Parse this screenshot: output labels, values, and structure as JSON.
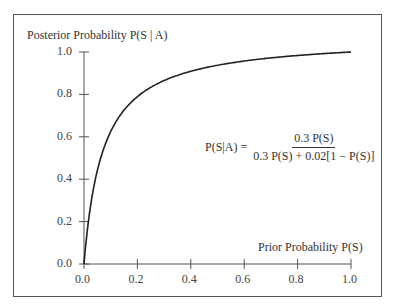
{
  "chart_data": {
    "type": "line",
    "title": "",
    "ylabel": "Posterior Probability P(S | A)",
    "xlabel": "Prior Probability P(S)",
    "xlim": [
      0,
      1
    ],
    "ylim": [
      0,
      1
    ],
    "x_ticks": [
      "0.0",
      "0.2",
      "0.4",
      "0.6",
      "0.8",
      "1.0"
    ],
    "y_ticks": [
      "0.0",
      "0.2",
      "0.4",
      "0.6",
      "0.8",
      "1.0"
    ],
    "grid": false,
    "annotation": {
      "lhs": "P(S|A) =",
      "numerator": "0.3 P(S)",
      "denominator": "0.3 P(S) + 0.02[1 − P(S)]"
    },
    "series": [
      {
        "name": "P(S|A)",
        "formula": "0.3x/(0.3x+0.02(1-x))",
        "x": [
          0,
          0.01,
          0.02,
          0.05,
          0.1,
          0.2,
          0.3,
          0.4,
          0.5,
          0.6,
          0.7,
          0.8,
          0.9,
          1.0
        ],
        "y": [
          0,
          0.13,
          0.23,
          0.44,
          0.63,
          0.79,
          0.87,
          0.91,
          0.94,
          0.96,
          0.97,
          0.98,
          0.99,
          1.0
        ]
      }
    ]
  }
}
